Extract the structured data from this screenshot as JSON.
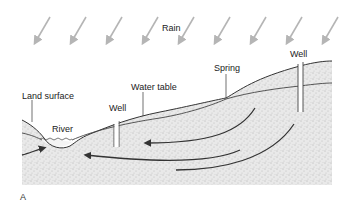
{
  "diagram": {
    "type": "groundwater cross-section",
    "figure_letter": "A",
    "labels": {
      "rain": "Rain",
      "land_surface": "Land surface",
      "river": "River",
      "well_left": "Well",
      "water_table": "Water table",
      "spring": "Spring",
      "well_right": "Well"
    },
    "rain_arrow_count": 9,
    "flow_arrow_count": 4,
    "colors": {
      "rain_arrow": "#b5b5b5",
      "line": "#333333",
      "ground_fill": "#e6e6e6",
      "stipple": "#8a8a8a"
    }
  }
}
